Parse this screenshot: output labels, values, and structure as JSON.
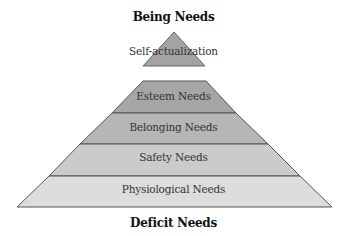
{
  "diagram": {
    "title_top": "Being Needs",
    "title_bottom": "Deficit Needs",
    "levels": [
      {
        "label": "Self-actualization",
        "color": "#a3a3a3"
      },
      {
        "label": "Esteem Needs",
        "color": "#a6a6a6"
      },
      {
        "label": "Belonging Needs",
        "color": "#b6b6b6"
      },
      {
        "label": "Safety Needs",
        "color": "#cbcbcb"
      },
      {
        "label": "Physiological Needs",
        "color": "#dddddd"
      }
    ],
    "border_color": "#555555"
  }
}
